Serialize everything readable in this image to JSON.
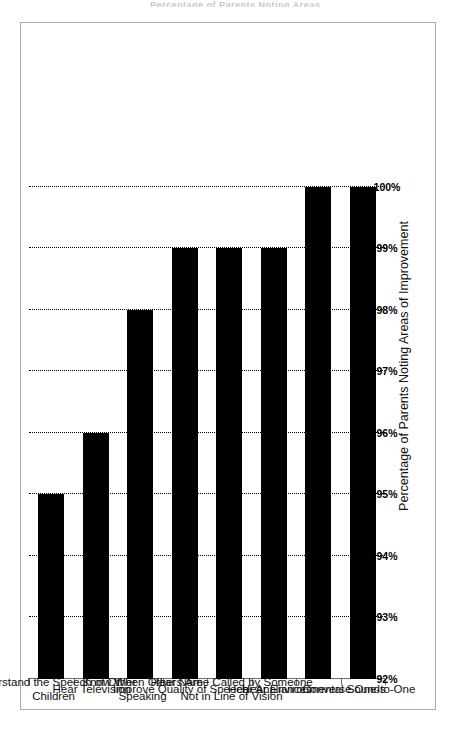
{
  "title_sliver": "Percentage of Parents Noting Areas of Improvement",
  "axis_title": "Percentage of Parents Noting Areas of Improvement",
  "chart_data": {
    "type": "bar",
    "title": "",
    "orientation": "vertical",
    "xlabel": "",
    "ylabel": "Percentage of Parents Noting Areas of Improvement",
    "ylim": [
      92,
      100
    ],
    "ytick_labels": [
      "92%",
      "93%",
      "94%",
      "95%",
      "96%",
      "97%",
      "98%",
      "99%",
      "100%"
    ],
    "ytick_values": [
      92,
      93,
      94,
      95,
      96,
      97,
      98,
      99,
      100
    ],
    "grid": true,
    "grid_style": "dotted",
    "legend": false,
    "bar_color": "#000000",
    "categories": [
      "Understand the Speech of Other Children",
      "Hear Television",
      "Know When Others Are Speaking",
      "Improve Quality of Speech",
      "Hear Name Called by Someone Not in Line of Vision",
      "Hear Appliances",
      "Hear Environmental Sounds",
      "Converse One-to-One"
    ],
    "values": [
      95,
      96,
      98,
      99,
      99,
      99,
      100,
      100
    ]
  }
}
